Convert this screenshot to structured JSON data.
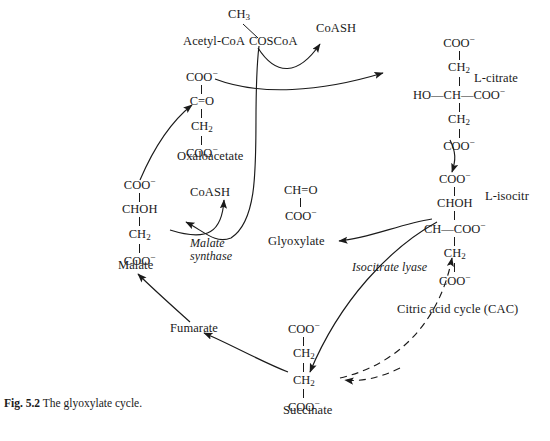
{
  "figure": {
    "number": "Fig. 5.2",
    "caption": "The glyoxylate cycle."
  },
  "metabolites": {
    "acetyl_coa": {
      "name": "Acetyl-CoA",
      "top_group": "CH3",
      "main_group": "COSCoA"
    },
    "coash_top": "CoASH",
    "coash_mid": "CoASH",
    "citrate": {
      "name": "L-citrate",
      "groups": [
        "COO-",
        "CH2",
        "HO-CH-COO-",
        "CH2",
        "COO-"
      ]
    },
    "isocitrate": {
      "name": "L-isocitr",
      "groups": [
        "COO-",
        "CHOH",
        "CH-COO-",
        "CH2",
        "COO-"
      ]
    },
    "oxaloacetate": {
      "name": "Oxaloacetate",
      "groups": [
        "COO-",
        "C=O",
        "CH2",
        "COO-"
      ]
    },
    "malate": {
      "name": "Malate",
      "groups": [
        "COO-",
        "CHOH",
        "CH2",
        "COO-"
      ]
    },
    "glyoxylate": {
      "name": "Glyoxylate",
      "groups": [
        "CH=O",
        "COO-"
      ]
    },
    "succinate": {
      "name": "Succinate",
      "groups": [
        "COO-",
        "CH2",
        "CH2",
        "COO-"
      ]
    },
    "fumarate": {
      "name": "Fumarate"
    }
  },
  "enzymes": {
    "malate_synthase_line1": "Malate",
    "malate_synthase_line2": "synthase",
    "isocitrate_lyase": "Isocitrate lyase"
  },
  "pathways": {
    "cac": "Citric acid cycle (CAC)"
  },
  "colors": {
    "ink": "#1a1a1a",
    "background": "#ffffff"
  }
}
